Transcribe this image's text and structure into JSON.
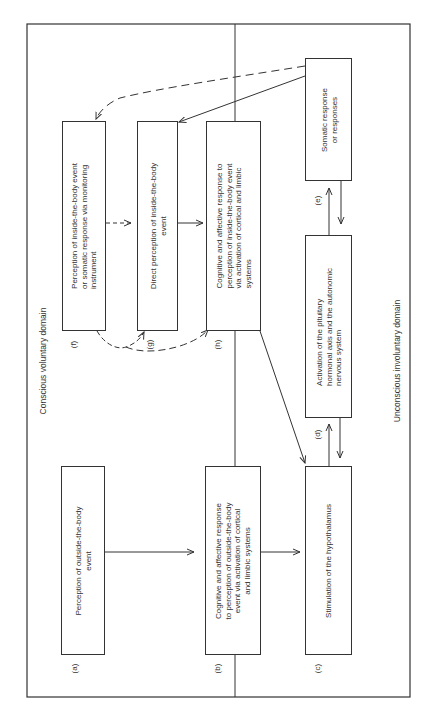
{
  "diagram": {
    "domains": {
      "conscious": "Conscious voluntary domain",
      "unconscious": "Unconscious involuntary domain"
    },
    "nodes": {
      "a": {
        "label": "(a)",
        "text": "Perception of outside-the-body\nevent"
      },
      "b": {
        "label": "(b)",
        "text": "Cognitive and affective response\nto perception of outside-the-body\nevent via activation of cortical\nand limbic systems"
      },
      "c": {
        "label": "(c)",
        "text": "Stimulation of the hypothalamus"
      },
      "d": {
        "label": "(d)",
        "text": "Activation of the pituitary\nhormonal axis and the autonomic\nnervous system"
      },
      "e": {
        "label": "(e)",
        "text": "Somatic response\nor responses"
      },
      "f": {
        "label": "(f)",
        "text": "Perception of inside-the-body event\nor somatic response via monitoring\ninstrument"
      },
      "g": {
        "label": "(g)",
        "text": "Direct perception of inside-the-body\nevent"
      },
      "h": {
        "label": "(h)",
        "text": "Cognitive and affective response to\nperception of inside-the-body event\nvia activation of cortical and limbic\nsystems"
      }
    },
    "edges": [
      {
        "from": "a",
        "to": "b",
        "style": "solid"
      },
      {
        "from": "b",
        "to": "c",
        "style": "solid"
      },
      {
        "from": "c",
        "to": "d",
        "style": "solid",
        "bidirectional": true
      },
      {
        "from": "d",
        "to": "e",
        "style": "solid",
        "bidirectional": true
      },
      {
        "from": "e",
        "to": "f",
        "style": "dashed"
      },
      {
        "from": "e",
        "to": "g",
        "style": "solid"
      },
      {
        "from": "f",
        "to": "g",
        "style": "dashed"
      },
      {
        "from": "f",
        "to": "g",
        "style": "dashed-curve"
      },
      {
        "from": "f",
        "to": "h",
        "style": "dashed-curve"
      },
      {
        "from": "g",
        "to": "h",
        "style": "solid"
      },
      {
        "from": "h",
        "to": "c",
        "style": "solid"
      }
    ]
  }
}
